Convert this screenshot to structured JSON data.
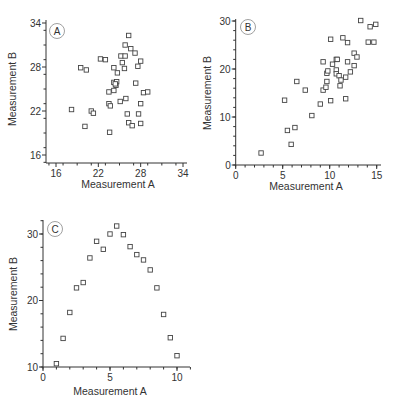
{
  "chart_data": [
    {
      "type": "scatter",
      "panel_label": "A",
      "title": "",
      "xlabel": "Measurement A",
      "ylabel": "Measurement B",
      "xlim": [
        15,
        34
      ],
      "ylim": [
        15,
        34
      ],
      "xticks": [
        16,
        22,
        28,
        34
      ],
      "yticks": [
        16,
        22,
        28,
        34
      ],
      "grid": false,
      "marker": "open-square",
      "points": [
        [
          26.3,
          32.3
        ],
        [
          25.8,
          31.0
        ],
        [
          26.6,
          30.5
        ],
        [
          27.2,
          29.9
        ],
        [
          25.2,
          29.5
        ],
        [
          25.8,
          29.5
        ],
        [
          22.3,
          29.1
        ],
        [
          23.0,
          29.0
        ],
        [
          28.0,
          28.8
        ],
        [
          25.4,
          28.6
        ],
        [
          27.6,
          28.1
        ],
        [
          19.5,
          27.9
        ],
        [
          20.3,
          27.6
        ],
        [
          24.2,
          27.9
        ],
        [
          25.7,
          27.8
        ],
        [
          24.7,
          27.2
        ],
        [
          27.3,
          25.8
        ],
        [
          24.2,
          25.9
        ],
        [
          24.6,
          26.0
        ],
        [
          24.5,
          25.5
        ],
        [
          24.4,
          25.7
        ],
        [
          24.2,
          24.8
        ],
        [
          23.5,
          24.6
        ],
        [
          28.4,
          24.5
        ],
        [
          29.0,
          24.6
        ],
        [
          25.9,
          23.7
        ],
        [
          25.1,
          23.3
        ],
        [
          23.5,
          23.0
        ],
        [
          23.7,
          22.7
        ],
        [
          28.0,
          23.0
        ],
        [
          18.2,
          22.2
        ],
        [
          21.0,
          22.0
        ],
        [
          21.3,
          21.7
        ],
        [
          26.1,
          21.6
        ],
        [
          27.7,
          21.6
        ],
        [
          26.3,
          20.4
        ],
        [
          26.8,
          20.0
        ],
        [
          28.0,
          20.3
        ],
        [
          20.1,
          19.9
        ],
        [
          23.6,
          19.1
        ]
      ]
    },
    {
      "type": "scatter",
      "panel_label": "B",
      "title": "",
      "xlabel": "Measurement A",
      "ylabel": "Measurement B",
      "xlim": [
        0,
        15
      ],
      "ylim": [
        0,
        30
      ],
      "xticks": [
        0,
        5,
        10,
        15
      ],
      "yticks": [
        0,
        10,
        20,
        30
      ],
      "grid": false,
      "marker": "open-square",
      "points": [
        [
          2.7,
          2.5
        ],
        [
          5.9,
          4.3
        ],
        [
          5.5,
          7.2
        ],
        [
          6.3,
          7.8
        ],
        [
          8.1,
          10.3
        ],
        [
          5.2,
          13.5
        ],
        [
          9.0,
          12.7
        ],
        [
          10.1,
          13.4
        ],
        [
          11.7,
          13.8
        ],
        [
          7.4,
          15.6
        ],
        [
          6.5,
          17.4
        ],
        [
          9.3,
          15.6
        ],
        [
          9.6,
          16.2
        ],
        [
          9.7,
          17.4
        ],
        [
          11.1,
          16.5
        ],
        [
          9.7,
          19.1
        ],
        [
          9.8,
          19.6
        ],
        [
          10.7,
          19.8
        ],
        [
          10.7,
          19.0
        ],
        [
          11.0,
          18.6
        ],
        [
          11.2,
          17.7
        ],
        [
          11.7,
          18.3
        ],
        [
          12.2,
          19.4
        ],
        [
          9.3,
          21.5
        ],
        [
          10.3,
          21.0
        ],
        [
          10.7,
          22.0
        ],
        [
          10.8,
          22.0
        ],
        [
          11.9,
          21.5
        ],
        [
          12.6,
          20.7
        ],
        [
          12.6,
          23.3
        ],
        [
          12.9,
          22.5
        ],
        [
          10.1,
          26.2
        ],
        [
          11.4,
          26.5
        ],
        [
          11.9,
          25.5
        ],
        [
          13.3,
          30.1
        ],
        [
          14.3,
          28.8
        ],
        [
          14.9,
          29.3
        ],
        [
          14.1,
          25.6
        ],
        [
          14.7,
          25.6
        ]
      ]
    },
    {
      "type": "scatter",
      "panel_label": "C",
      "title": "",
      "xlabel": "Measurement A",
      "ylabel": "Measurement B",
      "xlim": [
        0,
        11
      ],
      "ylim": [
        10,
        32
      ],
      "xticks": [
        0,
        5,
        10
      ],
      "yticks": [
        10,
        20,
        30
      ],
      "grid": false,
      "marker": "open-square",
      "points": [
        [
          1.0,
          10.5
        ],
        [
          1.5,
          14.3
        ],
        [
          2.0,
          18.2
        ],
        [
          2.5,
          21.9
        ],
        [
          3.0,
          22.7
        ],
        [
          3.5,
          26.4
        ],
        [
          4.0,
          28.9
        ],
        [
          4.5,
          27.7
        ],
        [
          5.0,
          30.0
        ],
        [
          5.5,
          31.2
        ],
        [
          6.0,
          29.9
        ],
        [
          6.5,
          28.1
        ],
        [
          7.0,
          26.9
        ],
        [
          7.5,
          26.1
        ],
        [
          8.0,
          24.6
        ],
        [
          8.5,
          21.9
        ],
        [
          9.0,
          17.9
        ],
        [
          9.5,
          14.4
        ],
        [
          10.0,
          11.7
        ]
      ]
    }
  ]
}
